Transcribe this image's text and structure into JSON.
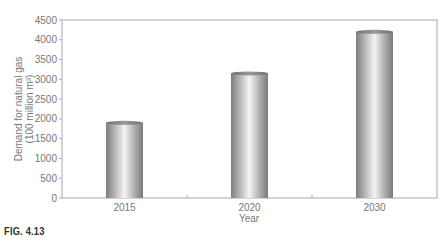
{
  "chart_data": {
    "type": "bar",
    "title": "",
    "categories": [
      "2015",
      "2020",
      "2030"
    ],
    "values": [
      1900,
      3150,
      4200
    ],
    "xlabel": "Year",
    "ylabel": "Demand for natural gas (100 million m³)",
    "ylabel_lines": [
      "Demand for natural gas",
      "(100 million m³)"
    ],
    "ylim": [
      0,
      4500
    ],
    "yticks": [
      0,
      500,
      1000,
      1500,
      2000,
      2500,
      3000,
      3500,
      4000,
      4500
    ],
    "grid": false,
    "legend": null,
    "style": "3D cylinder bars, grayscale gradient"
  },
  "caption": "FIG. 4.13",
  "colors": {
    "bar_dark": "#8a8a8a",
    "bar_light": "#f2f2f2",
    "axis": "#aaaaaa"
  }
}
